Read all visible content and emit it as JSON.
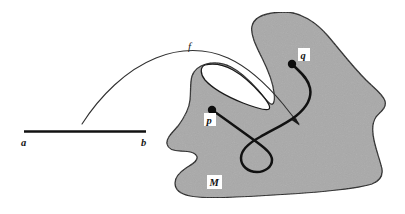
{
  "figure": {
    "domain_segment": {
      "name": "interval-ab",
      "left_endpoint_label": "a",
      "right_endpoint_label": "b",
      "x_start": 24,
      "x_end": 146,
      "y": 132
    },
    "map_arrow": {
      "name": "map-f",
      "label": "f",
      "label_x": 191,
      "label_y": 49,
      "arrow_tip_x": 299,
      "arrow_tip_y": 124
    },
    "region": {
      "name": "manifold-M",
      "label": "M",
      "label_x": 214,
      "label_y": 186,
      "fill_color": "#a9a9a9",
      "stroke_color": "#1a1a1a"
    },
    "points": [
      {
        "name": "point-p",
        "label": "p",
        "cx": 212,
        "cy": 110,
        "label_x": 210,
        "label_y": 124
      },
      {
        "name": "point-q",
        "label": "q",
        "label_x": 304,
        "label_y": 59,
        "cx": 292,
        "cy": 64
      }
    ],
    "path_curve": {
      "name": "path-p-to-q",
      "stroke_color": "#111111"
    },
    "colors": {
      "background": "#ffffff",
      "ink": "#151515",
      "region_gray": "#a9a9a9",
      "thin_curve": "#2b2b2b"
    }
  }
}
